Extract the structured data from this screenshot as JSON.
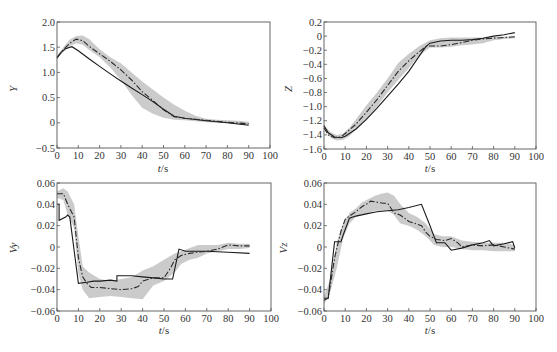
{
  "chart_data": [
    {
      "id": "Y",
      "type": "line",
      "title": "",
      "xlabel": "t/s",
      "ylabel": "Y",
      "xlim": [
        0,
        100
      ],
      "ylim": [
        -0.5,
        2.0
      ],
      "xticks": [
        0,
        10,
        20,
        30,
        40,
        50,
        60,
        70,
        80,
        90,
        100
      ],
      "yticks": [
        -0.5,
        0,
        0.5,
        1.0,
        1.5,
        2.0
      ],
      "ytick_labels": [
        "-0.5",
        "0",
        "0.5",
        "1.0",
        "1.5",
        "2.0"
      ],
      "frame": {
        "x0": 57,
        "x1": 270,
        "y0": 22,
        "y1": 148
      },
      "grid": false,
      "series": [
        {
          "name": "solid",
          "style": "solid",
          "x": [
            0,
            2,
            4,
            7,
            10,
            15,
            20,
            25,
            30,
            35,
            40,
            45,
            50,
            55,
            60,
            70,
            80,
            90
          ],
          "y": [
            1.28,
            1.4,
            1.47,
            1.51,
            1.43,
            1.27,
            1.12,
            0.97,
            0.83,
            0.69,
            0.56,
            0.42,
            0.27,
            0.13,
            0.09,
            0.04,
            0.0,
            -0.05
          ]
        },
        {
          "name": "dash-dot",
          "style": "dashdot",
          "x": [
            0,
            3,
            6,
            9,
            12,
            15,
            20,
            25,
            30,
            35,
            40,
            45,
            50,
            55,
            60,
            70,
            80,
            90
          ],
          "y": [
            1.3,
            1.45,
            1.58,
            1.66,
            1.63,
            1.52,
            1.37,
            1.22,
            1.05,
            0.85,
            0.62,
            0.44,
            0.26,
            0.12,
            0.09,
            0.05,
            0.01,
            -0.02
          ]
        },
        {
          "name": "band",
          "style": "band",
          "x": [
            0,
            3,
            6,
            9,
            12,
            15,
            20,
            25,
            30,
            35,
            40,
            45,
            50,
            55,
            60,
            65,
            70,
            75,
            80,
            85,
            90
          ],
          "upper": [
            1.32,
            1.5,
            1.65,
            1.72,
            1.73,
            1.66,
            1.46,
            1.3,
            1.18,
            1.0,
            0.82,
            0.66,
            0.5,
            0.36,
            0.24,
            0.14,
            0.08,
            0.06,
            0.05,
            0.04,
            0.02
          ],
          "lower": [
            1.28,
            1.4,
            1.52,
            1.58,
            1.55,
            1.45,
            1.3,
            1.1,
            0.85,
            0.55,
            0.3,
            0.18,
            0.1,
            0.06,
            0.05,
            0.03,
            0.01,
            0.0,
            -0.01,
            -0.03,
            -0.04
          ]
        }
      ]
    },
    {
      "id": "Z",
      "type": "line",
      "title": "",
      "xlabel": "t/s",
      "ylabel": "Z",
      "xlim": [
        0,
        100
      ],
      "ylim": [
        -1.6,
        0.2
      ],
      "xticks": [
        0,
        10,
        20,
        30,
        40,
        50,
        60,
        70,
        80,
        90,
        100
      ],
      "yticks": [
        -1.6,
        -1.4,
        -1.2,
        -1.0,
        -0.8,
        -0.6,
        -0.4,
        -0.2,
        0,
        0.2
      ],
      "ytick_labels": [
        "-1.6",
        "-1.4",
        "-1.2",
        "-1.0",
        "-0.8",
        "-0.6",
        "-0.4",
        "-0.2",
        "0",
        "0.2"
      ],
      "frame": {
        "x0": 324,
        "x1": 536,
        "y0": 22,
        "y1": 149
      },
      "grid": false,
      "series": [
        {
          "name": "solid",
          "style": "solid",
          "x": [
            0,
            2,
            5,
            8,
            10,
            15,
            20,
            25,
            30,
            35,
            40,
            45,
            48,
            50,
            55,
            60,
            65,
            70,
            75,
            80,
            85,
            90
          ],
          "y": [
            -1.27,
            -1.37,
            -1.43,
            -1.44,
            -1.42,
            -1.32,
            -1.18,
            -1.02,
            -0.85,
            -0.68,
            -0.5,
            -0.28,
            -0.15,
            -0.1,
            -0.07,
            -0.06,
            -0.06,
            -0.05,
            -0.03,
            0.0,
            0.02,
            0.05
          ]
        },
        {
          "name": "dash-dot",
          "style": "dashdot",
          "x": [
            0,
            2,
            5,
            8,
            10,
            15,
            20,
            25,
            30,
            35,
            40,
            45,
            48,
            50,
            55,
            60,
            65,
            70,
            75,
            80,
            85,
            90
          ],
          "y": [
            -1.3,
            -1.4,
            -1.44,
            -1.43,
            -1.38,
            -1.25,
            -1.08,
            -0.9,
            -0.7,
            -0.5,
            -0.35,
            -0.22,
            -0.15,
            -0.14,
            -0.14,
            -0.12,
            -0.09,
            -0.06,
            -0.04,
            -0.03,
            -0.02,
            -0.01
          ]
        },
        {
          "name": "band",
          "style": "band",
          "x": [
            0,
            3,
            6,
            9,
            12,
            15,
            20,
            25,
            30,
            35,
            40,
            45,
            50,
            55,
            60,
            65,
            70,
            75,
            80,
            85,
            90
          ],
          "upper": [
            -1.26,
            -1.36,
            -1.4,
            -1.38,
            -1.3,
            -1.18,
            -0.98,
            -0.8,
            -0.6,
            -0.38,
            -0.25,
            -0.14,
            -0.06,
            -0.03,
            -0.02,
            -0.02,
            -0.02,
            -0.02,
            -0.01,
            -0.01,
            0.0
          ],
          "lower": [
            -1.32,
            -1.44,
            -1.48,
            -1.47,
            -1.42,
            -1.32,
            -1.17,
            -1.0,
            -0.8,
            -0.62,
            -0.45,
            -0.27,
            -0.16,
            -0.16,
            -0.15,
            -0.13,
            -0.12,
            -0.1,
            -0.06,
            -0.04,
            -0.03
          ]
        }
      ]
    },
    {
      "id": "Vy",
      "type": "line",
      "title": "",
      "xlabel": "t/s",
      "ylabel": "Vy",
      "xlim": [
        0,
        100
      ],
      "ylim": [
        -0.06,
        0.06
      ],
      "xticks": [
        0,
        10,
        20,
        30,
        40,
        50,
        60,
        70,
        80,
        90,
        100
      ],
      "yticks": [
        -0.06,
        -0.04,
        -0.02,
        0,
        0.02,
        0.04,
        0.06
      ],
      "ytick_labels": [
        "-0.06",
        "-0.04",
        "-0.02",
        "0",
        "0.02",
        "0.04",
        "0.06"
      ],
      "frame": {
        "x0": 57,
        "x1": 271,
        "y0": 183,
        "y1": 311
      },
      "grid": false,
      "series": [
        {
          "name": "solid",
          "style": "solid",
          "x": [
            0,
            1,
            1,
            4,
            5,
            6,
            10,
            14,
            17,
            20,
            25,
            28,
            28,
            35,
            40,
            45,
            50,
            54,
            57,
            60,
            70,
            80,
            90
          ],
          "y": [
            0.04,
            0.04,
            0.025,
            0.028,
            0.03,
            0.028,
            -0.034,
            -0.033,
            -0.032,
            -0.032,
            -0.031,
            -0.032,
            -0.027,
            -0.027,
            -0.028,
            -0.029,
            -0.03,
            -0.03,
            -0.002,
            -0.004,
            -0.004,
            -0.005,
            -0.006
          ]
        },
        {
          "name": "dash-dot",
          "style": "dashdot",
          "x": [
            0,
            3,
            5,
            8,
            10,
            12,
            14,
            16,
            20,
            25,
            30,
            35,
            38,
            40,
            45,
            50,
            53,
            55,
            58,
            62,
            65,
            70,
            75,
            80,
            85,
            90
          ],
          "y": [
            0.05,
            0.05,
            0.04,
            0.028,
            -0.01,
            -0.028,
            -0.034,
            -0.038,
            -0.038,
            -0.039,
            -0.04,
            -0.039,
            -0.037,
            -0.032,
            -0.029,
            -0.029,
            -0.02,
            -0.012,
            -0.008,
            -0.006,
            -0.005,
            -0.004,
            -0.002,
            0.002,
            0.001,
            0.001
          ]
        },
        {
          "name": "band",
          "style": "band",
          "x": [
            0,
            3,
            5,
            8,
            10,
            12,
            15,
            20,
            25,
            30,
            35,
            40,
            45,
            50,
            55,
            58,
            62,
            66,
            70,
            75,
            80,
            85,
            90
          ],
          "upper": [
            0.052,
            0.055,
            0.052,
            0.04,
            0.01,
            -0.018,
            -0.024,
            -0.03,
            -0.032,
            -0.03,
            -0.028,
            -0.022,
            -0.018,
            -0.012,
            -0.006,
            -0.004,
            -0.001,
            0.002,
            0.002,
            0.002,
            0.004,
            0.003,
            0.003
          ],
          "lower": [
            0.046,
            0.044,
            0.03,
            0.018,
            -0.025,
            -0.04,
            -0.048,
            -0.047,
            -0.046,
            -0.047,
            -0.048,
            -0.049,
            -0.036,
            -0.032,
            -0.024,
            -0.016,
            -0.012,
            -0.01,
            -0.006,
            -0.004,
            -0.002,
            -0.002,
            -0.001
          ]
        }
      ]
    },
    {
      "id": "Vz",
      "type": "line",
      "title": "",
      "xlabel": "t/s",
      "ylabel": "Vz",
      "xlim": [
        0,
        100
      ],
      "ylim": [
        -0.06,
        0.06
      ],
      "xticks": [
        0,
        10,
        20,
        30,
        40,
        50,
        60,
        70,
        80,
        90,
        100
      ],
      "yticks": [
        -0.06,
        -0.04,
        -0.02,
        0,
        0.02,
        0.04,
        0.06
      ],
      "ytick_labels": [
        "-0.06",
        "-0.04",
        "-0.02",
        "0",
        "0.02",
        "0.04",
        "0.06"
      ],
      "frame": {
        "x0": 324,
        "x1": 536,
        "y0": 183,
        "y1": 311
      },
      "grid": false,
      "series": [
        {
          "name": "solid",
          "style": "solid",
          "x": [
            0,
            2,
            5,
            8,
            9,
            12,
            15,
            20,
            25,
            30,
            35,
            40,
            46,
            50,
            53,
            57,
            60,
            65,
            70,
            75,
            78,
            80,
            85,
            89,
            90
          ],
          "y": [
            -0.048,
            -0.048,
            0.005,
            0.005,
            0.011,
            0.027,
            0.029,
            0.031,
            0.033,
            0.034,
            0.035,
            0.037,
            0.04,
            0.02,
            0.004,
            0.004,
            -0.003,
            -0.001,
            0.002,
            0.004,
            0.006,
            0.001,
            0.003,
            0.005,
            -0.001
          ]
        },
        {
          "name": "dash-dot",
          "style": "dashdot",
          "x": [
            0,
            2,
            5,
            8,
            10,
            12,
            15,
            18,
            20,
            22,
            25,
            28,
            30,
            33,
            36,
            40,
            43,
            46,
            48,
            50,
            53,
            57,
            60,
            63,
            65,
            70,
            75,
            80,
            85,
            90
          ],
          "y": [
            -0.05,
            -0.048,
            -0.01,
            0.015,
            0.026,
            0.029,
            0.033,
            0.038,
            0.04,
            0.043,
            0.042,
            0.041,
            0.041,
            0.032,
            0.03,
            0.024,
            0.022,
            0.02,
            0.014,
            0.01,
            0.007,
            0.006,
            0.008,
            0.004,
            0.0,
            0.002,
            0.001,
            0.002,
            0.0,
            -0.002
          ]
        },
        {
          "name": "band",
          "style": "band",
          "x": [
            0,
            3,
            6,
            9,
            12,
            15,
            18,
            21,
            24,
            27,
            30,
            33,
            36,
            40,
            44,
            48,
            52,
            56,
            60,
            65,
            70,
            75,
            80,
            85,
            90
          ],
          "upper": [
            -0.046,
            -0.03,
            0.004,
            0.022,
            0.032,
            0.036,
            0.042,
            0.045,
            0.048,
            0.05,
            0.051,
            0.048,
            0.04,
            0.032,
            0.028,
            0.022,
            0.012,
            0.01,
            0.01,
            0.006,
            0.005,
            0.004,
            0.004,
            0.004,
            0.002
          ],
          "lower": [
            -0.054,
            -0.042,
            -0.02,
            0.008,
            0.022,
            0.028,
            0.03,
            0.032,
            0.034,
            0.034,
            0.034,
            0.03,
            0.022,
            0.02,
            0.016,
            0.01,
            0.002,
            0.0,
            0.0,
            -0.002,
            -0.003,
            -0.003,
            -0.004,
            -0.004,
            -0.004
          ]
        }
      ]
    }
  ],
  "panels": {
    "Y": {
      "ylabel": "Y",
      "xlabel_var": "t",
      "xlabel_unit": "/s"
    },
    "Z": {
      "ylabel": "Z",
      "xlabel_var": "t",
      "xlabel_unit": "/s"
    },
    "Vy": {
      "ylabel": "Vy",
      "xlabel_var": "t",
      "xlabel_unit": "/s"
    },
    "Vz": {
      "ylabel": "Vz",
      "xlabel_var": "t",
      "xlabel_unit": "/s"
    }
  },
  "colors": {
    "band": "#c8c8c8",
    "line": "#1a1a1a",
    "frame": "#555555",
    "text": "#333333"
  }
}
